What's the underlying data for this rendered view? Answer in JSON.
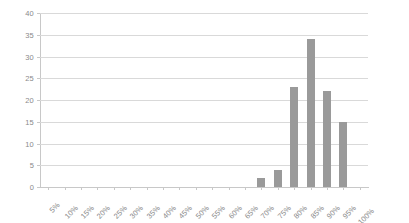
{
  "chart_data": {
    "type": "bar",
    "title": "",
    "xlabel": "",
    "ylabel": "",
    "categories": [
      "5%",
      "10%",
      "15%",
      "20%",
      "25%",
      "30%",
      "35%",
      "40%",
      "45%",
      "50%",
      "55%",
      "60%",
      "65%",
      "70%",
      "75%",
      "80%",
      "85%",
      "90%",
      "95%",
      "100%"
    ],
    "values": [
      0,
      0,
      0,
      0,
      0,
      0,
      0,
      0,
      0,
      0,
      0,
      0,
      0,
      2,
      4,
      23,
      34,
      22,
      15,
      0
    ],
    "ylim": [
      0,
      40
    ],
    "y_ticks": [
      0,
      5,
      10,
      15,
      20,
      25,
      30,
      35,
      40
    ],
    "y_tick_labels": [
      "0",
      "5",
      "10",
      "15",
      "20",
      "25",
      "30",
      "35",
      "40"
    ],
    "grid": true,
    "legend": "none",
    "bar_color": "#9a9a9a",
    "gridline_color": "#d9d9d9",
    "axis_color": "#c8c8c8",
    "label_color": "#8a8a8a",
    "background": "#ffffff"
  }
}
